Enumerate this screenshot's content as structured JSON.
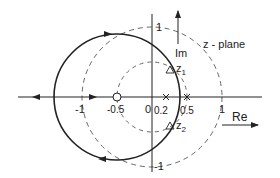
{
  "diagram": {
    "plane_label": "z - plane",
    "axes": {
      "real_label": "Re",
      "imag_label": "Im"
    },
    "ticks": {
      "real": [
        {
          "value": -1,
          "label": "-1"
        },
        {
          "value": -0.5,
          "label": "-0.5"
        },
        {
          "value": 0,
          "label": "0"
        },
        {
          "value": 0.2,
          "label": "0.2"
        },
        {
          "value": 0.5,
          "label": "0.5"
        },
        {
          "value": 1,
          "label": "1"
        }
      ],
      "imag": [
        {
          "value": 1,
          "label": "1"
        },
        {
          "value": -1,
          "label": "-1"
        }
      ]
    },
    "zeros": [
      {
        "re": -0.5,
        "im": 0
      }
    ],
    "poles": [
      {
        "re": 0.2,
        "im": 0
      },
      {
        "re": 0.5,
        "im": 0
      }
    ],
    "points": [
      {
        "label": "z",
        "sub": "1"
      },
      {
        "label": "z",
        "sub": "2"
      }
    ],
    "dashed_circles": [
      {
        "center": [
          0,
          0
        ],
        "radius": 1
      },
      {
        "center": [
          0,
          0
        ],
        "radius": 0.5
      }
    ],
    "root_locus_circle": {
      "center": [
        -0.5,
        0
      ],
      "radius": 0.9
    },
    "colors": {
      "stroke": "#222222",
      "dashed": "#555555"
    }
  }
}
